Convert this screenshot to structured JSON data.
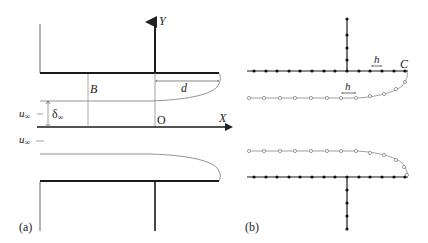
{
  "figure": {
    "panel_a": {
      "label": "(a)",
      "axis_y_label": "Y",
      "axis_x_label": "X",
      "origin_label": "O",
      "width_label": "B",
      "length_label": "d",
      "thickness_label": "δ",
      "thickness_sub": "∞",
      "velocity_upper_label": "u",
      "velocity_upper_sub": "∞",
      "velocity_lower_label": "u",
      "velocity_lower_sub": "∞"
    },
    "panel_b": {
      "label": "(b)",
      "spacing_label_wall": "h",
      "spacing_label_surface": "h",
      "corner_label": "C"
    },
    "colors": {
      "wall": "#1a1a1a",
      "thin_line": "#888888",
      "node_filled": "#111111",
      "node_open_stroke": "#777777"
    }
  }
}
